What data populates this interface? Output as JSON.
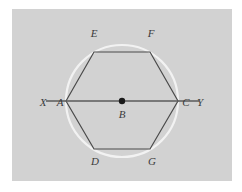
{
  "figure": {
    "background_color": "#ffffff",
    "panel_color": "#d2d2d2",
    "circle_color": "#f2f2f2",
    "polygon_color": "#4a4a4a",
    "line_color": "#5a5a5a",
    "center_dot_color": "#1a1a1a",
    "label_color": "#3b3b3b",
    "circle": {
      "center_x": 122,
      "center_y": 101,
      "radius": 56
    },
    "hexagon": {
      "sides": 6,
      "vertices": [
        {
          "name": "A",
          "x": 66,
          "y": 101
        },
        {
          "name": "E",
          "x": 94,
          "y": 52
        },
        {
          "name": "F",
          "x": 150,
          "y": 52
        },
        {
          "name": "C",
          "x": 178,
          "y": 101
        },
        {
          "name": "G",
          "x": 150,
          "y": 149
        },
        {
          "name": "D",
          "x": 94,
          "y": 149
        }
      ]
    },
    "secant_line": {
      "name": "XY",
      "x1": 46,
      "y1": 101,
      "x2": 199,
      "y2": 101
    },
    "center_point": {
      "name": "B",
      "x": 122,
      "y": 101,
      "dot_radius": 3.2
    },
    "labels": [
      {
        "id": "label-X",
        "text": "X",
        "x": 43,
        "y": 106,
        "anchor": "middle"
      },
      {
        "id": "label-A",
        "text": "A",
        "x": 60,
        "y": 106,
        "anchor": "middle"
      },
      {
        "id": "label-B",
        "text": "B",
        "x": 122,
        "y": 118,
        "anchor": "middle"
      },
      {
        "id": "label-C",
        "text": "C",
        "x": 186,
        "y": 106,
        "anchor": "middle"
      },
      {
        "id": "label-Y",
        "text": "Y",
        "x": 200,
        "y": 106,
        "anchor": "middle"
      },
      {
        "id": "label-E",
        "text": "E",
        "x": 94,
        "y": 37,
        "anchor": "middle"
      },
      {
        "id": "label-F",
        "text": "F",
        "x": 151,
        "y": 37,
        "anchor": "middle"
      },
      {
        "id": "label-D",
        "text": "D",
        "x": 95,
        "y": 165,
        "anchor": "middle"
      },
      {
        "id": "label-G",
        "text": "G",
        "x": 152,
        "y": 165,
        "anchor": "middle"
      }
    ]
  }
}
